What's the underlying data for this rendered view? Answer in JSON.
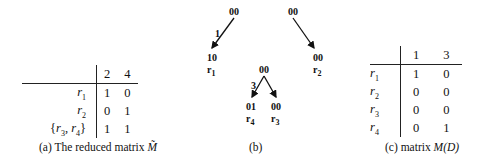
{
  "panel_a": {
    "caption_prefix": "(a) The reduced matrix ",
    "caption_symbol": "M̃",
    "columns": [
      "2",
      "4"
    ],
    "rows": [
      {
        "label": "r1",
        "label_base": "r",
        "label_sub": "1",
        "values": [
          "1",
          "0"
        ]
      },
      {
        "label": "r2",
        "label_base": "r",
        "label_sub": "2",
        "values": [
          "0",
          "1"
        ]
      },
      {
        "label": "{r3, r4}",
        "values": [
          "1",
          "1"
        ]
      }
    ]
  },
  "panel_b": {
    "caption": "(b)",
    "trees": [
      {
        "root": "00",
        "children": [
          {
            "edge_label": "1",
            "node": "10",
            "leaf": "r1"
          }
        ]
      },
      {
        "root": "00",
        "children": [
          {
            "edge_label": "",
            "node": "00",
            "leaf": "r2"
          }
        ]
      },
      {
        "root": "00",
        "edge_label": "3",
        "children": [
          {
            "node": "01",
            "leaf": "r4"
          },
          {
            "node": "00",
            "leaf": "r3"
          }
        ]
      }
    ],
    "labels": {
      "t1_root": "00",
      "t1_edge": "1",
      "t1_child": "10",
      "t1_leaf_base": "r",
      "t1_leaf_sub": "1",
      "t2_root": "00",
      "t2_child": "00",
      "t2_leaf_base": "r",
      "t2_leaf_sub": "2",
      "t3_root": "00",
      "t3_edge": "3",
      "t3_left": "01",
      "t3_left_leaf_base": "r",
      "t3_left_leaf_sub": "4",
      "t3_right": "00",
      "t3_right_leaf_base": "r",
      "t3_right_leaf_sub": "3"
    }
  },
  "panel_c": {
    "caption_prefix": "(c) matrix ",
    "caption_symbol": "M(D)",
    "columns": [
      "1",
      "3"
    ],
    "rows": [
      {
        "label_base": "r",
        "label_sub": "1",
        "values": [
          "1",
          "0"
        ]
      },
      {
        "label_base": "r",
        "label_sub": "2",
        "values": [
          "0",
          "0"
        ]
      },
      {
        "label_base": "r",
        "label_sub": "3",
        "values": [
          "0",
          "0"
        ]
      },
      {
        "label_base": "r",
        "label_sub": "4",
        "values": [
          "0",
          "1"
        ]
      }
    ]
  }
}
